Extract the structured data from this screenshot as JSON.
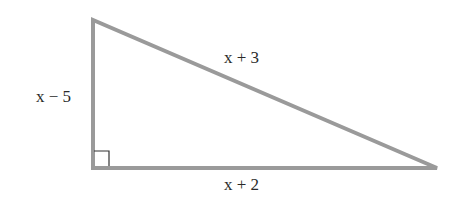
{
  "diagram": {
    "type": "right-triangle",
    "stroke_color": "#9a9a9a",
    "vertices": {
      "top": [
        93,
        20
      ],
      "right_angle": [
        93,
        168
      ],
      "right": [
        437,
        168
      ]
    },
    "labels": {
      "vertical_leg": "x − 5",
      "hypotenuse": "x + 3",
      "horizontal_leg": "x + 2"
    },
    "right_angle_marker": true
  }
}
